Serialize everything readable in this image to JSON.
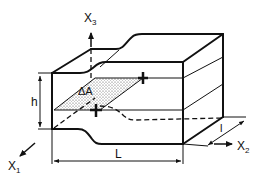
{
  "figure": {
    "type": "3D block with constriction, cross-sectional area element",
    "colors": {
      "line": "#111111",
      "background": "#ffffff",
      "shading": "#777777"
    }
  },
  "labels": {
    "x3": {
      "base": "X",
      "sub": "3"
    },
    "x1": {
      "base": "X",
      "sub": "1"
    },
    "x2": {
      "base": "X",
      "sub": "2"
    },
    "height": "h",
    "length": "L",
    "width": "l",
    "area": "ΔA"
  }
}
